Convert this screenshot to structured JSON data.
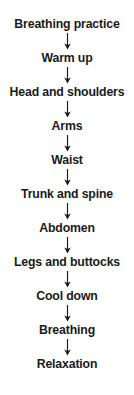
{
  "diagram": {
    "type": "vertical-flowchart",
    "connector_icon": "arrow-down-icon",
    "text_color": "#1a1a1a",
    "background_color": "#ffffff",
    "steps": [
      {
        "label": "Breathing practice"
      },
      {
        "label": "Warm up"
      },
      {
        "label": "Head and shoulders"
      },
      {
        "label": "Arms"
      },
      {
        "label": "Waist"
      },
      {
        "label": "Trunk and spine"
      },
      {
        "label": "Abdomen"
      },
      {
        "label": "Legs and buttocks"
      },
      {
        "label": "Cool down"
      },
      {
        "label": "Breathing"
      },
      {
        "label": "Relaxation"
      }
    ]
  }
}
